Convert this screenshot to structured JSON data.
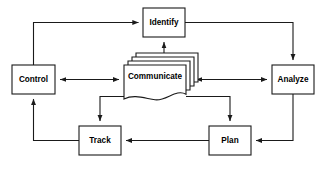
{
  "diagram": {
    "type": "flowchart",
    "colors": {
      "background": "#ffffff",
      "stroke": "#1a1a1a",
      "node_fill": "#ffffff",
      "label": "#000000"
    },
    "nodes": [
      {
        "id": "identify",
        "label": "Identify",
        "shape": "rectangle",
        "x": 143,
        "y": 8,
        "width": 42,
        "height": 29
      },
      {
        "id": "control",
        "label": "Control",
        "shape": "rectangle",
        "x": 12,
        "y": 65,
        "width": 43,
        "height": 29
      },
      {
        "id": "communicate",
        "label": "Communicate",
        "shape": "multi-document",
        "sheets": 4,
        "x": 124,
        "y": 65,
        "width": 62,
        "height": 29
      },
      {
        "id": "analyze",
        "label": "Analyze",
        "shape": "rectangle",
        "x": 272,
        "y": 65,
        "width": 42,
        "height": 29
      },
      {
        "id": "track",
        "label": "Track",
        "shape": "rectangle",
        "x": 79,
        "y": 126,
        "width": 42,
        "height": 29
      },
      {
        "id": "plan",
        "label": "Plan",
        "shape": "rectangle",
        "x": 209,
        "y": 126,
        "width": 42,
        "height": 29
      }
    ],
    "edges": [
      {
        "id": "control-to-identify",
        "from": "control",
        "to": "identify",
        "direction": "one-way",
        "arrow_at": "identify"
      },
      {
        "id": "identify-to-analyze",
        "from": "identify",
        "to": "analyze",
        "direction": "one-way",
        "arrow_at": "analyze"
      },
      {
        "id": "identify-communicate",
        "from": "identify",
        "to": "communicate",
        "direction": "bidirectional",
        "arrow_at": "both"
      },
      {
        "id": "control-communicate",
        "from": "control",
        "to": "communicate",
        "direction": "bidirectional",
        "arrow_at": "both"
      },
      {
        "id": "communicate-analyze",
        "from": "communicate",
        "to": "analyze",
        "direction": "bidirectional",
        "arrow_at": "both"
      },
      {
        "id": "communicate-to-track",
        "from": "communicate",
        "to": "track",
        "direction": "one-way",
        "arrow_at": "track"
      },
      {
        "id": "communicate-to-plan",
        "from": "communicate",
        "to": "plan",
        "direction": "one-way",
        "arrow_at": "plan"
      },
      {
        "id": "track-to-control",
        "from": "track",
        "to": "control",
        "direction": "one-way",
        "arrow_at": "control"
      },
      {
        "id": "plan-to-track",
        "from": "plan",
        "to": "track",
        "direction": "one-way",
        "arrow_at": "track"
      },
      {
        "id": "analyze-to-plan",
        "from": "analyze",
        "to": "plan",
        "direction": "one-way",
        "arrow_at": "plan"
      }
    ]
  }
}
